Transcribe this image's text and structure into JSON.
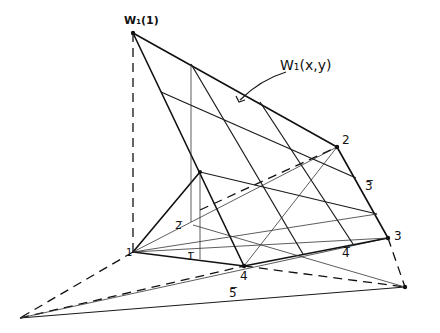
{
  "diagram": {
    "title_label": "W₁(x,y)",
    "apex_label": "W₁(1)",
    "vertex_labels": {
      "v1": "1",
      "v2": "2",
      "v3": "3",
      "v4": "4"
    },
    "edge_labels": {
      "e1": "1̅",
      "e2": "2̅",
      "e3": "3̅",
      "e4": "4̅",
      "e5": "5̅"
    },
    "colors": {
      "ink": "#111111",
      "background": "#ffffff"
    }
  }
}
